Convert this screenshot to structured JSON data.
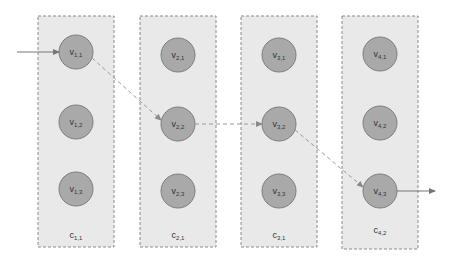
{
  "diagram": {
    "columns": [
      {
        "id": "c1",
        "label": "c",
        "label_sub": "1,1",
        "nodes": [
          {
            "label": "v",
            "sub": "1,1"
          },
          {
            "label": "v",
            "sub": "1,2"
          },
          {
            "label": "v",
            "sub": "1,3"
          }
        ]
      },
      {
        "id": "c2",
        "label": "c",
        "label_sub": "2,1",
        "nodes": [
          {
            "label": "v",
            "sub": "2,1"
          },
          {
            "label": "v",
            "sub": "2,2"
          },
          {
            "label": "v",
            "sub": "2,3"
          }
        ]
      },
      {
        "id": "c3",
        "label": "c",
        "label_sub": "3,1",
        "nodes": [
          {
            "label": "v",
            "sub": "3,1"
          },
          {
            "label": "v",
            "sub": "3,2"
          },
          {
            "label": "v",
            "sub": "3,3"
          }
        ]
      },
      {
        "id": "c4",
        "label": "c",
        "label_sub": "4,2",
        "nodes": [
          {
            "label": "v",
            "sub": "4,1"
          },
          {
            "label": "v",
            "sub": "4,2"
          },
          {
            "label": "v",
            "sub": "4,3"
          }
        ]
      }
    ],
    "path": [
      {
        "from": "input",
        "to": "v1,1",
        "style": "solid"
      },
      {
        "from": "v1,1",
        "to": "v2,2",
        "style": "dashed"
      },
      {
        "from": "v2,2",
        "to": "v3,2",
        "style": "dashed"
      },
      {
        "from": "v3,2",
        "to": "v4,3",
        "style": "dashed"
      },
      {
        "from": "v4,3",
        "to": "output",
        "style": "solid"
      }
    ],
    "colors": {
      "column_fill": "#e9e9e9",
      "column_border": "#8a8a8a",
      "node_fill": "#a9a9a9",
      "node_border": "#7d7d7d",
      "edge": "#8a8a8a"
    }
  }
}
